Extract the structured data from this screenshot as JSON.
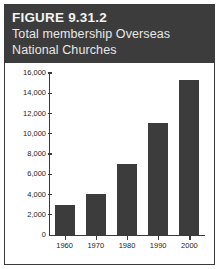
{
  "figure": {
    "number_label": "FIGURE 9.31.2",
    "subtitle": "Total membership Overseas\nNational Churches",
    "header_bg": "#3c3c3c",
    "header_text_color": "#f2f2f2",
    "border_color": "#3a3a3a"
  },
  "chart_data": {
    "type": "bar",
    "title": "Total membership Overseas National Churches",
    "xlabel": "",
    "ylabel": "",
    "categories": [
      "1960",
      "1970",
      "1980",
      "1990",
      "2000"
    ],
    "values": [
      3000,
      4100,
      7000,
      11100,
      15300
    ],
    "ylim": [
      0,
      16000
    ],
    "ytick_labels": [
      "16,000",
      "14,000",
      "12,000",
      "10,000",
      "8,000",
      "6,000",
      "4,000",
      "2,000",
      "0"
    ],
    "ytick_values": [
      16000,
      14000,
      12000,
      10000,
      8000,
      6000,
      4000,
      2000,
      0
    ],
    "grid": false,
    "legend": null,
    "bar_color": "#3c3c3c",
    "axis_color": "#3a3a3a"
  }
}
